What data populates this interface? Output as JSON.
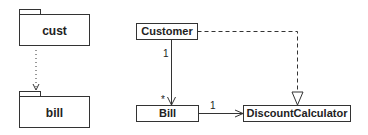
{
  "packages": [
    {
      "name": "cust"
    },
    {
      "name": "bill"
    }
  ],
  "classes": [
    {
      "name": "Customer"
    },
    {
      "name": "Bill"
    },
    {
      "name": "DiscountCalculator"
    }
  ],
  "relations": {
    "package_dependency": {
      "from": "cust",
      "to": "bill",
      "style": "dotted",
      "arrow": "open"
    },
    "customer_bill": {
      "from": "Customer",
      "to": "Bill",
      "source_multiplicity": "1",
      "target_multiplicity": "*",
      "arrow": "open"
    },
    "bill_discount": {
      "from": "Bill",
      "to": "DiscountCalculator",
      "source_multiplicity": "1",
      "arrow": "open"
    },
    "customer_discount": {
      "from": "Customer",
      "to": "DiscountCalculator",
      "style": "dashed",
      "arrow": "hollow-triangle"
    }
  },
  "colors": {
    "line": "#333333",
    "background": "#ffffff"
  }
}
